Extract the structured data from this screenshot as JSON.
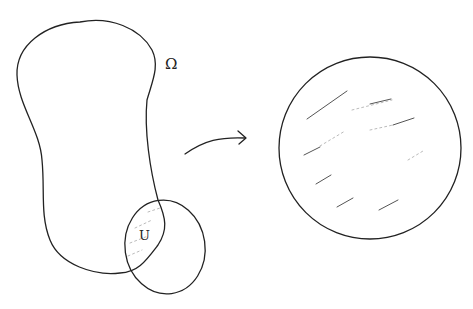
{
  "diagram": {
    "labels": {
      "domain": "Ω",
      "intersection": "U"
    },
    "colors": {
      "stroke": "#222222",
      "hatch": "#555555",
      "background": "#ffffff"
    },
    "elements": [
      {
        "id": "domain-omega",
        "type": "closed-curve",
        "label": "Ω"
      },
      {
        "id": "small-disk",
        "type": "ellipse"
      },
      {
        "id": "intersection-u",
        "type": "shaded-region",
        "label": "U"
      },
      {
        "id": "map-arrow",
        "type": "curved-arrow",
        "from": "intersection-u",
        "to": "target-disk"
      },
      {
        "id": "target-disk",
        "type": "circle",
        "shaded": true
      }
    ]
  }
}
